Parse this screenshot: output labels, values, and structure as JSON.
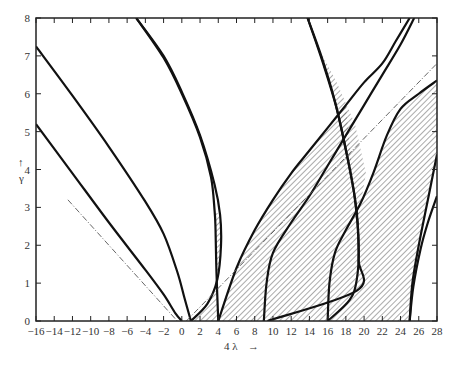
{
  "chart_data": {
    "type": "line",
    "title": "",
    "xlabel": "4 λ",
    "ylabel": "γ",
    "xlim": [
      -16,
      28
    ],
    "ylim": [
      0,
      8
    ],
    "grid": false,
    "legend": null,
    "x_ticks": [
      -16,
      -14,
      -12,
      -10,
      -8,
      -6,
      -4,
      -2,
      0,
      2,
      4,
      6,
      8,
      10,
      12,
      14,
      16,
      18,
      20,
      22,
      24,
      26,
      28
    ],
    "y_ticks": [
      0,
      1,
      2,
      3,
      4,
      5,
      6,
      7,
      8
    ],
    "series": [
      {
        "name": "curve-1",
        "points": [
          [
            -16,
            5.2
          ],
          [
            -12,
            3.9
          ],
          [
            -8,
            2.6
          ],
          [
            -4,
            1.35
          ],
          [
            -2,
            0.7
          ],
          [
            -0.7,
            0.2
          ],
          [
            0,
            0
          ]
        ]
      },
      {
        "name": "curve-2",
        "points": [
          [
            -16,
            7.25
          ],
          [
            -12,
            5.95
          ],
          [
            -8,
            4.6
          ],
          [
            -4,
            3.15
          ],
          [
            -2,
            2.3
          ],
          [
            -0.5,
            1.3
          ],
          [
            0.3,
            0.6
          ],
          [
            1,
            0
          ]
        ]
      },
      {
        "name": "curve-3",
        "points": [
          [
            -5,
            8
          ],
          [
            -2,
            7.0
          ],
          [
            0,
            6.05
          ],
          [
            2,
            4.9
          ],
          [
            3.6,
            3.6
          ],
          [
            4.2,
            2.8
          ],
          [
            4.3,
            2.0
          ],
          [
            3.9,
            1.1
          ],
          [
            2.8,
            0.45
          ],
          [
            1,
            0
          ]
        ]
      },
      {
        "name": "curve-4",
        "points": [
          [
            -5,
            8
          ],
          [
            -2,
            6.95
          ],
          [
            0,
            6.0
          ],
          [
            2,
            4.85
          ],
          [
            3.2,
            3.8
          ],
          [
            3.6,
            2.9
          ],
          [
            3.7,
            2.4
          ],
          [
            3.8,
            1.3
          ],
          [
            4,
            0
          ]
        ]
      },
      {
        "name": "curve-5",
        "points": [
          [
            4,
            0
          ],
          [
            6,
            1.4
          ],
          [
            8,
            2.4
          ],
          [
            10,
            3.2
          ],
          [
            12,
            3.9
          ],
          [
            14,
            4.5
          ],
          [
            16,
            5.1
          ],
          [
            18,
            5.7
          ],
          [
            20,
            6.3
          ],
          [
            22,
            6.8
          ],
          [
            23.5,
            7.4
          ],
          [
            25,
            8
          ]
        ]
      },
      {
        "name": "curve-6",
        "points": [
          [
            13.8,
            8
          ],
          [
            15.5,
            6.8
          ],
          [
            17,
            5.6
          ],
          [
            18.2,
            4.3
          ],
          [
            19,
            3.2
          ],
          [
            19.4,
            2.0
          ],
          [
            19.2,
            1.1
          ],
          [
            18.4,
            0.55
          ],
          [
            16,
            0
          ]
        ]
      },
      {
        "name": "curve-7",
        "points": [
          [
            13.8,
            8
          ],
          [
            15.3,
            7.0
          ],
          [
            16.8,
            5.8
          ],
          [
            18.0,
            4.5
          ],
          [
            18.9,
            3.4
          ],
          [
            19.3,
            2.6
          ],
          [
            19.4,
            1.6
          ],
          [
            19.2,
            0.8
          ],
          [
            9.4,
            0
          ]
        ]
      },
      {
        "name": "curve-8",
        "points": [
          [
            9,
            0
          ],
          [
            9.3,
            1.0
          ],
          [
            10,
            1.8
          ],
          [
            12,
            2.6
          ],
          [
            14,
            3.3
          ],
          [
            16,
            4.1
          ],
          [
            18,
            4.9
          ],
          [
            20,
            5.7
          ],
          [
            22,
            6.5
          ],
          [
            24,
            7.3
          ],
          [
            25.5,
            8
          ]
        ]
      },
      {
        "name": "curve-9",
        "points": [
          [
            16,
            0
          ],
          [
            16.2,
            1.0
          ],
          [
            16.8,
            1.8
          ],
          [
            18,
            2.4
          ],
          [
            19.6,
            3.1
          ],
          [
            21,
            3.9
          ],
          [
            22.5,
            4.9
          ],
          [
            24,
            5.6
          ],
          [
            26,
            6.0
          ],
          [
            28,
            6.35
          ]
        ]
      },
      {
        "name": "curve-10",
        "points": [
          [
            25,
            0
          ],
          [
            25.3,
            1.0
          ],
          [
            26,
            2.0
          ],
          [
            27,
            3.2
          ],
          [
            28,
            4.4
          ]
        ]
      },
      {
        "name": "curve-11",
        "points": [
          [
            25,
            0
          ],
          [
            25.4,
            0.9
          ],
          [
            26.2,
            1.9
          ],
          [
            27,
            2.6
          ],
          [
            28,
            3.3
          ]
        ]
      },
      {
        "name": "dash-left",
        "style": "dash-dot",
        "points": [
          [
            -12.5,
            3.2
          ],
          [
            -0.5,
            0
          ]
        ]
      },
      {
        "name": "dash-right",
        "style": "dash-dot",
        "points": [
          [
            0.5,
            0
          ],
          [
            28,
            6.8
          ]
        ]
      }
    ],
    "shaded_regions": [
      {
        "name": "tongue-1",
        "points": [
          [
            1,
            0
          ],
          [
            2.8,
            0.45
          ],
          [
            3.9,
            1.1
          ],
          [
            4.3,
            2.0
          ],
          [
            4.2,
            2.8
          ],
          [
            3.6,
            2.9
          ],
          [
            3.8,
            1.3
          ],
          [
            4,
            0
          ],
          [
            1,
            0
          ]
        ]
      },
      {
        "name": "region-2",
        "points": [
          [
            4,
            0
          ],
          [
            6,
            1.4
          ],
          [
            8,
            2.4
          ],
          [
            10,
            3.2
          ],
          [
            12,
            3.9
          ],
          [
            14,
            4.5
          ],
          [
            16,
            5.1
          ],
          [
            18,
            5.7
          ],
          [
            19.0,
            3.2
          ],
          [
            19.4,
            2.0
          ],
          [
            19.2,
            1.1
          ],
          [
            18.4,
            0.55
          ],
          [
            16,
            0
          ],
          [
            16.2,
            1.0
          ],
          [
            16.8,
            1.8
          ],
          [
            18,
            2.4
          ],
          [
            19.6,
            3.1
          ],
          [
            21,
            3.9
          ],
          [
            22.5,
            4.9
          ],
          [
            24,
            5.6
          ],
          [
            26,
            6.0
          ],
          [
            28,
            6.35
          ],
          [
            28,
            4.4
          ],
          [
            27,
            3.2
          ],
          [
            26,
            2.0
          ],
          [
            25.3,
            1.0
          ],
          [
            25,
            0
          ],
          [
            4,
            0
          ]
        ]
      },
      {
        "name": "upper-tongue",
        "points": [
          [
            14.6,
            7.4
          ],
          [
            16.8,
            5.8
          ],
          [
            18,
            4.5
          ],
          [
            18.9,
            3.4
          ],
          [
            19.3,
            2.6
          ],
          [
            20.2,
            3.9
          ],
          [
            19,
            5.2
          ],
          [
            17,
            6.3
          ]
        ]
      }
    ]
  },
  "axis": {
    "xlabel": "4 λ",
    "xarrow": "→",
    "ylabel": "γ",
    "yarrow": "↑"
  }
}
